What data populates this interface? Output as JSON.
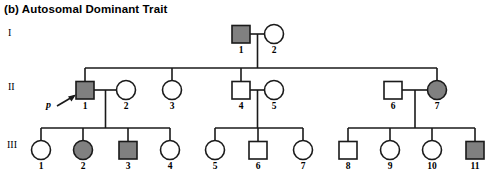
{
  "figure": {
    "title": "(b) Autosomal Dominant Trait",
    "proband_label": "p",
    "colors": {
      "affected_fill": "#808080",
      "unaffected_fill": "#ffffff",
      "stroke": "#1a1a1a",
      "background": "#ffffff"
    }
  },
  "generations": [
    {
      "label": "I",
      "y": 34
    },
    {
      "label": "II",
      "y": 88
    },
    {
      "label": "III",
      "y": 145
    }
  ],
  "individuals": [
    {
      "id": "I-1",
      "number": "1",
      "sex": "male",
      "affected": true,
      "gen": 1,
      "x": 241,
      "y": 34
    },
    {
      "id": "I-2",
      "number": "2",
      "sex": "female",
      "affected": false,
      "gen": 1,
      "x": 274,
      "y": 34
    },
    {
      "id": "II-1",
      "number": "1",
      "sex": "male",
      "affected": true,
      "gen": 2,
      "x": 85,
      "y": 90,
      "proband": true
    },
    {
      "id": "II-2",
      "number": "2",
      "sex": "female",
      "affected": false,
      "gen": 2,
      "x": 126,
      "y": 90
    },
    {
      "id": "II-3",
      "number": "3",
      "sex": "female",
      "affected": false,
      "gen": 2,
      "x": 172,
      "y": 90
    },
    {
      "id": "II-4",
      "number": "4",
      "sex": "male",
      "affected": false,
      "gen": 2,
      "x": 241,
      "y": 90
    },
    {
      "id": "II-5",
      "number": "5",
      "sex": "female",
      "affected": false,
      "gen": 2,
      "x": 274,
      "y": 90
    },
    {
      "id": "II-6",
      "number": "6",
      "sex": "male",
      "affected": false,
      "gen": 2,
      "x": 393,
      "y": 90
    },
    {
      "id": "II-7",
      "number": "7",
      "sex": "female",
      "affected": true,
      "gen": 2,
      "x": 437,
      "y": 90
    },
    {
      "id": "III-1",
      "number": "1",
      "sex": "female",
      "affected": false,
      "gen": 3,
      "x": 41,
      "y": 150
    },
    {
      "id": "III-2",
      "number": "2",
      "sex": "female",
      "affected": true,
      "gen": 3,
      "x": 83,
      "y": 150
    },
    {
      "id": "III-3",
      "number": "3",
      "sex": "male",
      "affected": true,
      "gen": 3,
      "x": 128,
      "y": 150
    },
    {
      "id": "III-4",
      "number": "4",
      "sex": "female",
      "affected": false,
      "gen": 3,
      "x": 170,
      "y": 150
    },
    {
      "id": "III-5",
      "number": "5",
      "sex": "female",
      "affected": false,
      "gen": 3,
      "x": 215,
      "y": 150
    },
    {
      "id": "III-6",
      "number": "6",
      "sex": "male",
      "affected": false,
      "gen": 3,
      "x": 258,
      "y": 150
    },
    {
      "id": "III-7",
      "number": "7",
      "sex": "female",
      "affected": false,
      "gen": 3,
      "x": 303,
      "y": 150
    },
    {
      "id": "III-8",
      "number": "8",
      "sex": "male",
      "affected": false,
      "gen": 3,
      "x": 348,
      "y": 150
    },
    {
      "id": "III-9",
      "number": "9",
      "sex": "female",
      "affected": false,
      "gen": 3,
      "x": 390,
      "y": 150
    },
    {
      "id": "III-10",
      "number": "10",
      "sex": "female",
      "affected": false,
      "gen": 3,
      "x": 432,
      "y": 150
    },
    {
      "id": "III-11",
      "number": "11",
      "sex": "male",
      "affected": true,
      "gen": 3,
      "x": 475,
      "y": 150
    }
  ],
  "matings": [
    {
      "id": "mating-I",
      "partners": [
        "I-1",
        "I-2"
      ],
      "children": [
        "II-1",
        "II-3",
        "II-4",
        "II-7"
      ]
    },
    {
      "id": "mating-II-1",
      "partners": [
        "II-1",
        "II-2"
      ],
      "children": [
        "III-1",
        "III-2",
        "III-3",
        "III-4"
      ]
    },
    {
      "id": "mating-II-4",
      "partners": [
        "II-4",
        "II-5"
      ],
      "children": [
        "III-5",
        "III-6",
        "III-7"
      ]
    },
    {
      "id": "mating-II-6",
      "partners": [
        "II-6",
        "II-7"
      ],
      "children": [
        "III-8",
        "III-9",
        "III-10",
        "III-11"
      ]
    }
  ]
}
